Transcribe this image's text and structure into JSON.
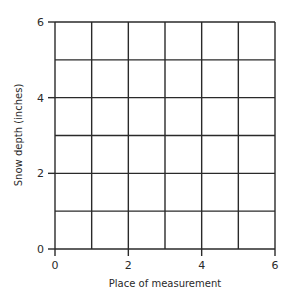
{
  "chart_data": {
    "type": "line",
    "title": "",
    "xlabel": "Place of measurement",
    "ylabel": "Snow depth (inches)",
    "xlim": [
      0,
      6
    ],
    "ylim": [
      0,
      6
    ],
    "x_ticks": [
      0,
      2,
      4,
      6
    ],
    "y_ticks": [
      0,
      2,
      4,
      6
    ],
    "x_tick_labels": [
      "0",
      "2",
      "4",
      "6"
    ],
    "y_tick_labels": [
      "0",
      "2",
      "4",
      "6"
    ],
    "grid": true,
    "grid_step_x": 1,
    "grid_step_y": 1,
    "series": [],
    "legend": null,
    "note": "Blank grid with no plotted data"
  },
  "colors": {
    "grid_line": "#2a2a2a",
    "text": "#2a2a2a",
    "background": "#ffffff"
  },
  "layout": {
    "plot_left": 55,
    "plot_right": 275,
    "plot_top": 22,
    "plot_bottom": 249
  }
}
